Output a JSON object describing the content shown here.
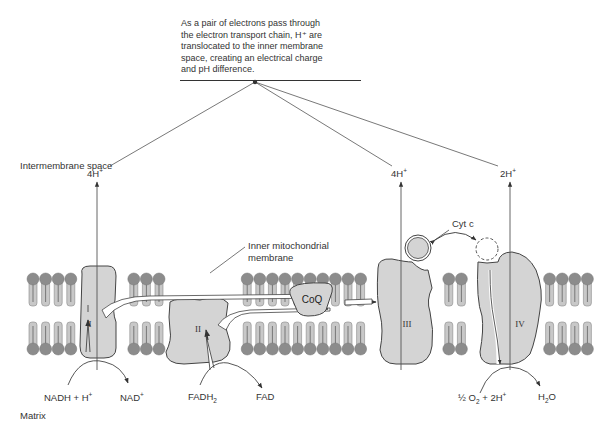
{
  "caption": {
    "lines": [
      "As a pair of electrons pass through",
      "the electron transport chain, H⁺ are",
      "translocated to the inner membrane",
      "space, creating an electrical charge",
      "and pH difference."
    ]
  },
  "regions": {
    "intermembrane": "Intermembrane space",
    "matrix": "Matrix",
    "inner_membrane_line1": "Inner mitochondrial",
    "inner_membrane_line2": "membrane"
  },
  "complexes": [
    {
      "id": "I",
      "label": "I",
      "protons": "4H",
      "proton_charge": "+"
    },
    {
      "id": "II",
      "label": "II"
    },
    {
      "id": "CoQ",
      "label": "CoQ"
    },
    {
      "id": "III",
      "label": "III",
      "protons": "4H",
      "proton_charge": "+"
    },
    {
      "id": "CytC",
      "label": "Cyt c"
    },
    {
      "id": "IV",
      "label": "IV",
      "protons": "2H",
      "proton_charge": "+"
    }
  ],
  "reactions": {
    "complex_I": {
      "substrate": "NADH + H",
      "substrate_sup": "+",
      "product": "NAD",
      "product_sup": "+"
    },
    "complex_II": {
      "substrate": "FADH",
      "substrate_sub": "2",
      "product": "FAD"
    },
    "complex_IV": {
      "substrate_prefix": "½ O",
      "substrate_sub": "2",
      "substrate_suffix": " + 2H",
      "substrate_sup": "+",
      "product_pre": "H",
      "product_sub": "2",
      "product_post": "O"
    }
  },
  "colors": {
    "protein_fill": "#d4d4d4",
    "lipid_head": "#8c8c8c",
    "lipid_tail": "#c8c8c8",
    "line": "#444444"
  }
}
